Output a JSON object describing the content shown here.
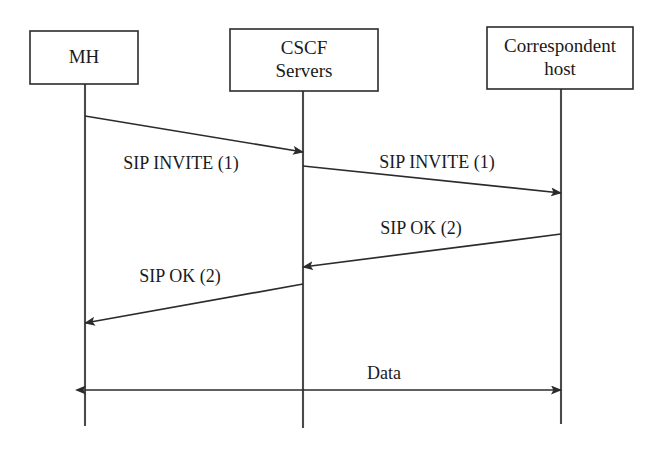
{
  "diagram": {
    "type": "sequence-diagram",
    "canvas": {
      "width": 661,
      "height": 451,
      "background": "#ffffff"
    },
    "stroke_color": "#2b2b2b",
    "lifeline_color": "#4a4a4a",
    "participants": [
      {
        "id": "mh",
        "name": "MH",
        "label_lines": [
          "MH"
        ],
        "box": {
          "x": 30,
          "y": 31,
          "width": 108,
          "height": 53
        },
        "lifeline_x": 85,
        "lifeline_top": 84,
        "lifeline_bottom": 426
      },
      {
        "id": "cscf",
        "name": "CSCF Servers",
        "label_lines": [
          "CSCF",
          "Servers"
        ],
        "box": {
          "x": 230,
          "y": 29,
          "width": 148,
          "height": 62
        },
        "lifeline_x": 303,
        "lifeline_top": 91,
        "lifeline_bottom": 428
      },
      {
        "id": "correspondent",
        "name": "Correspondent host",
        "label_lines": [
          "Correspondent",
          "host"
        ],
        "box": {
          "x": 487,
          "y": 27,
          "width": 146,
          "height": 62
        },
        "lifeline_x": 561,
        "lifeline_top": 89,
        "lifeline_bottom": 424
      }
    ],
    "messages": [
      {
        "id": "m1",
        "label": "SIP INVITE (1)",
        "sequence": 1,
        "from": "mh",
        "to": "cscf",
        "direction": "right",
        "x1": 85,
        "y1": 116,
        "x2": 303,
        "y2": 152,
        "label_x": 181,
        "label_y": 169,
        "arrowheads": "end"
      },
      {
        "id": "m2",
        "label": "SIP INVITE (1)",
        "sequence": 1,
        "from": "cscf",
        "to": "correspondent",
        "direction": "right",
        "x1": 303,
        "y1": 166,
        "x2": 561,
        "y2": 193,
        "label_x": 437,
        "label_y": 168,
        "arrowheads": "end"
      },
      {
        "id": "m3",
        "label": "SIP OK (2)",
        "sequence": 2,
        "from": "correspondent",
        "to": "cscf",
        "direction": "left",
        "x1": 561,
        "y1": 234,
        "x2": 303,
        "y2": 267,
        "label_x": 421,
        "label_y": 234,
        "arrowheads": "end"
      },
      {
        "id": "m4",
        "label": "SIP OK (2)",
        "sequence": 2,
        "from": "cscf",
        "to": "mh",
        "direction": "left",
        "x1": 303,
        "y1": 284,
        "x2": 85,
        "y2": 323,
        "label_x": 180,
        "label_y": 282,
        "arrowheads": "end"
      },
      {
        "id": "m5",
        "label": "Data",
        "sequence": null,
        "from": "mh",
        "to": "correspondent",
        "direction": "both",
        "x1": 85,
        "y1": 390,
        "x2": 561,
        "y2": 390,
        "label_x": 384,
        "label_y": 379,
        "arrowheads": "both"
      }
    ]
  }
}
